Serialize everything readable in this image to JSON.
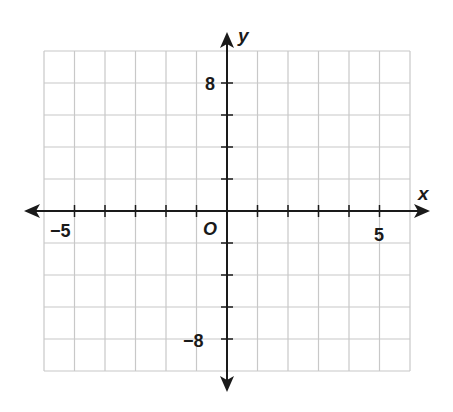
{
  "chart_data": {
    "type": "coordinate-grid",
    "title": "",
    "xlabel": "x",
    "ylabel": "y",
    "origin_label": "O",
    "xlim": [
      -6,
      6
    ],
    "ylim": [
      -10,
      10
    ],
    "x_grid_step": 1,
    "y_grid_step": 2,
    "grid": true,
    "x_tick_labels": [
      {
        "value": -5,
        "label": "−5"
      },
      {
        "value": 5,
        "label": "5"
      }
    ],
    "y_tick_labels": [
      {
        "value": 8,
        "label": "8"
      },
      {
        "value": -8,
        "label": "−8"
      }
    ],
    "series": []
  },
  "labels": {
    "x_axis": "x",
    "y_axis": "y",
    "origin": "O",
    "x_neg": "−5",
    "x_pos": "5",
    "y_pos": "8",
    "y_neg": "−8"
  },
  "colors": {
    "grid": "#c8c8c8",
    "axis": "#1a1a1a"
  }
}
